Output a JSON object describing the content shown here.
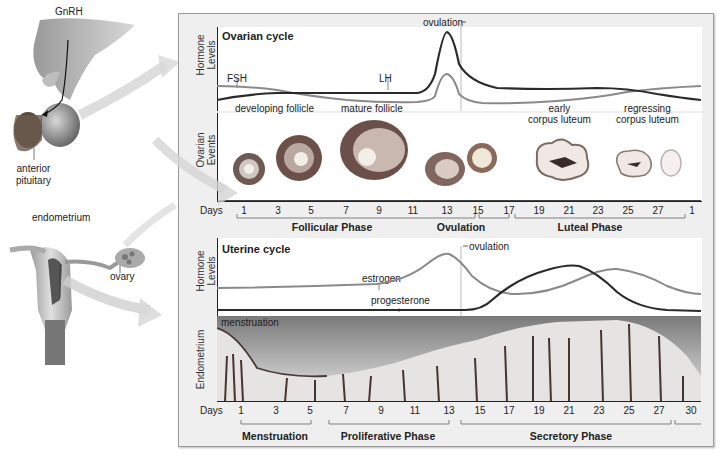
{
  "anatomy": {
    "gnrh": "GnRH",
    "anterior_pituitary": "anterior pituitary",
    "anterior_line1": "anterior",
    "anterior_line2": "pituitary",
    "endometrium": "endometrium",
    "ovary": "ovary"
  },
  "ovarian": {
    "title": "Ovarian cycle",
    "ylabel_hormone_1": "Hormone",
    "ylabel_hormone_2": "Levels",
    "ylabel_events_1": "Ovarian",
    "ylabel_events_2": "Events",
    "fsh": "FSH",
    "lh": "LH",
    "ovulation": "ovulation",
    "events": {
      "developing": "developing follicle",
      "mature": "mature follicle",
      "early_cl_1": "early",
      "early_cl_2": "corpus luteum",
      "regress_1": "regressing",
      "regress_2": "corpus luteum"
    },
    "days_label": "Days",
    "days": [
      "1",
      "3",
      "5",
      "7",
      "9",
      "11",
      "13",
      "15",
      "17",
      "19",
      "21",
      "23",
      "25",
      "27",
      "1"
    ],
    "phases": [
      "Follicular Phase",
      "Ovulation",
      "Luteal Phase"
    ]
  },
  "uterine": {
    "title": "Uterine cycle",
    "ylabel_hormone_1": "Hormone",
    "ylabel_hormone_2": "Levels",
    "ylabel_endo": "Endometrium",
    "estrogen": "estrogen",
    "progesterone": "progesterone",
    "ovulation": "ovulation",
    "menstruation_label": "menstruation",
    "days_label": "Days",
    "days": [
      "1",
      "3",
      "5",
      "7",
      "9",
      "11",
      "13",
      "15",
      "17",
      "19",
      "21",
      "23",
      "25",
      "27",
      "30"
    ],
    "phases": [
      "Menstruation",
      "Proliferative Phase",
      "Secretory Phase"
    ]
  },
  "colors": {
    "dark_line": "#2a2a2a",
    "light_line": "#8a8a8a",
    "panel_bg": "#efefef",
    "tissue": "#7a5a4a"
  }
}
